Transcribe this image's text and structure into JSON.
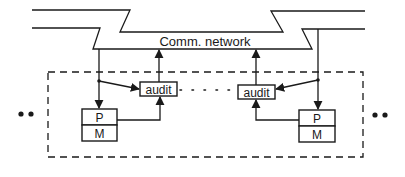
{
  "diagram": {
    "network": {
      "label": "Comm. network"
    },
    "left_node": {
      "audit_label": "audit",
      "processor_label": "P",
      "memory_label": "M"
    },
    "right_node": {
      "audit_label": "audit",
      "processor_label": "P",
      "memory_label": "M"
    },
    "colors": {
      "stroke": "#1a1a1a",
      "background": "#ffffff"
    }
  }
}
